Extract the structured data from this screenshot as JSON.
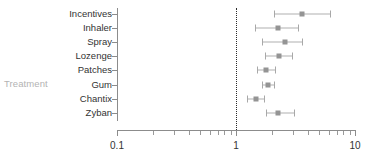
{
  "chart_data": {
    "type": "scatter",
    "title": "",
    "xlabel": "",
    "ylabel": "Treatment",
    "xscale": "log",
    "xlim": [
      0.1,
      10
    ],
    "xtick_labels": [
      "0.1",
      "1",
      "10"
    ],
    "xtick_values": [
      0.1,
      1,
      10
    ],
    "grid": false,
    "legend": "none",
    "reference_line": 1.0,
    "annotations": [
      "dotted vertical reference line at x = 1"
    ],
    "categories": [
      "Incentives",
      "Inhaler",
      "Spray",
      "Lozenge",
      "Patches",
      "Gum",
      "Chantix",
      "Zyban"
    ],
    "estimates": [
      3.56,
      2.25,
      2.57,
      2.3,
      1.78,
      1.86,
      1.48,
      2.25
    ],
    "ci_low": [
      2.1,
      1.44,
      1.64,
      1.74,
      1.5,
      1.64,
      1.23,
      1.78
    ],
    "ci_high": [
      6.19,
      3.32,
      3.56,
      2.93,
      2.11,
      2.07,
      1.73,
      3.05
    ],
    "points": [
      {
        "label": "Incentives",
        "estimate": 3.56,
        "ci_low": 2.1,
        "ci_high": 6.19
      },
      {
        "label": "Inhaler",
        "estimate": 2.25,
        "ci_low": 1.44,
        "ci_high": 3.32
      },
      {
        "label": "Spray",
        "estimate": 2.57,
        "ci_low": 1.64,
        "ci_high": 3.56
      },
      {
        "label": "Lozenge",
        "estimate": 2.3,
        "ci_low": 1.74,
        "ci_high": 2.93
      },
      {
        "label": "Patches",
        "estimate": 1.78,
        "ci_low": 1.5,
        "ci_high": 2.11
      },
      {
        "label": "Gum",
        "estimate": 1.86,
        "ci_low": 1.64,
        "ci_high": 2.07
      },
      {
        "label": "Chantix",
        "estimate": 1.48,
        "ci_low": 1.23,
        "ci_high": 1.73
      },
      {
        "label": "Zyban",
        "estimate": 2.25,
        "ci_low": 1.78,
        "ci_high": 3.05
      }
    ]
  },
  "axis": {
    "y_title": "Treatment",
    "x_labels": [
      {
        "text": "0.1",
        "value": 0.1
      },
      {
        "text": "1",
        "value": 1
      },
      {
        "text": "10",
        "value": 10
      }
    ]
  },
  "colors": {
    "marker": "#949494",
    "whisker": "#b0b0b0",
    "axis": "#8c8c8c",
    "reference": "#2b2b2b",
    "label": "#333333",
    "axis_title": "#b3b3b3",
    "background": "#ffffff"
  }
}
